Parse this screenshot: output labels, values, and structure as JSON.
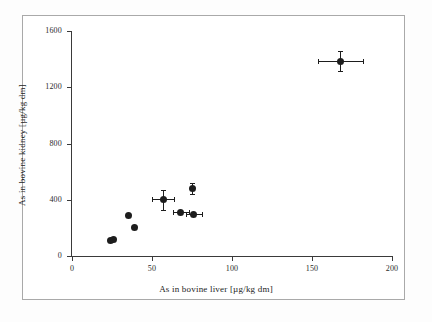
{
  "chart_data": {
    "type": "scatter",
    "title": "",
    "xlabel": "As in bovine liver [µg/kg dm]",
    "ylabel": "As in bovine kidney [µg/kg dm]",
    "xlim": [
      0,
      200
    ],
    "ylim": [
      0,
      1600
    ],
    "xticks": [
      0,
      50,
      100,
      150,
      200
    ],
    "yticks": [
      0,
      400,
      800,
      1200,
      1600
    ],
    "xtick_labels": [
      "0",
      "50",
      "100",
      "150",
      "200"
    ],
    "ytick_labels": [
      "0",
      "400",
      "800",
      "1200",
      "1600"
    ],
    "grid": false,
    "legend": false,
    "marker": "filled-circle",
    "marker_color": "#1d1d1d",
    "axis_color": "#3a3a3a",
    "frame_color": "#a9a9a9",
    "background": "#ffffff",
    "points": [
      {
        "x": 24,
        "y": 110,
        "xerr": 0,
        "yerr": 0
      },
      {
        "x": 26,
        "y": 118,
        "xerr": 0,
        "yerr": 0
      },
      {
        "x": 35,
        "y": 285,
        "xerr": 0,
        "yerr": 0
      },
      {
        "x": 39,
        "y": 205,
        "xerr": 0,
        "yerr": 0
      },
      {
        "x": 57,
        "y": 400,
        "xerr": 7,
        "yerr": 70
      },
      {
        "x": 68,
        "y": 310,
        "xerr": 5,
        "yerr": 0
      },
      {
        "x": 76,
        "y": 292,
        "xerr": 5,
        "yerr": 0
      },
      {
        "x": 75,
        "y": 480,
        "xerr": 0,
        "yerr": 38
      },
      {
        "x": 168,
        "y": 1385,
        "xerr": 14,
        "yerr": 70
      }
    ]
  }
}
